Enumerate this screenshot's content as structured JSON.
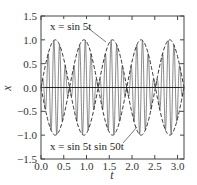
{
  "chart_data": {
    "type": "line",
    "title": "",
    "xlabel": "t",
    "ylabel": "x",
    "xlim": [
      0,
      3.14159
    ],
    "ylim": [
      -1.5,
      1.5
    ],
    "grid": false,
    "legend": "none (inline annotations)",
    "x_ticks": [
      "0.0",
      "0.5",
      "1.0",
      "1.5",
      "2.0",
      "2.5",
      "3.0"
    ],
    "y_ticks": [
      "1.5",
      "1.0",
      "0.5",
      "0.0",
      "-0.5",
      "-1.0",
      "-1.5"
    ],
    "series": [
      {
        "name": "x = sin 5t",
        "style": "dashed envelope (±)",
        "function": "sin(5t)",
        "amplitude": 1.0
      },
      {
        "name": "x = sin 5t sin 50t",
        "style": "solid",
        "function": "sin(5t)*sin(50t)",
        "amplitude": 1.0
      }
    ],
    "annotations": [
      {
        "text": "x = sin 5t",
        "points_to": "dashed envelope near t≈1.0, x≈0.75"
      },
      {
        "text": "x = sin 5t sin 50t",
        "points_to": "solid curve near t≈1.45, x≈-0.55"
      }
    ],
    "zero_line": true
  },
  "labels": {
    "xlabel": "t",
    "ylabel": "x",
    "annot_top": "x = sin 5t",
    "annot_bottom": "x = sin 5t sin 50t",
    "xticks": [
      "0.0",
      "0.5",
      "1.0",
      "1.5",
      "2.0",
      "2.5",
      "3.0"
    ],
    "yticks": [
      "1.5",
      "1.0",
      "0.5",
      "0.0",
      "−0.5",
      "−1.0",
      "−1.5"
    ]
  },
  "colors": {
    "line": "#333333",
    "carrier": "#555555",
    "background": "#ffffff"
  }
}
